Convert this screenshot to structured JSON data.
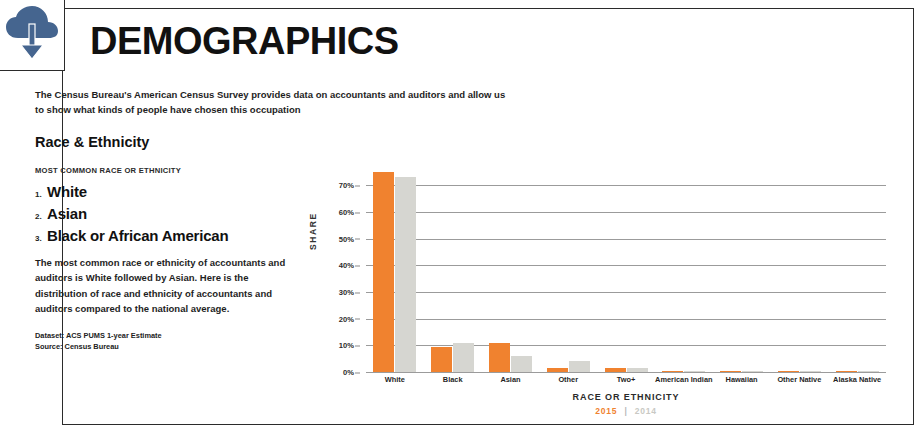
{
  "icons": {
    "cloud_download": "cloud-download-icon",
    "cloud_color": "#45658f"
  },
  "header": {
    "title": "DEMOGRAPHICS",
    "intro_line1": "The Census Bureau's American Census Survey provides data on accountants and auditors and allow us",
    "intro_line2": "to show what kinds of people have chosen this occupation",
    "section_heading": "Race & Ethnicity"
  },
  "left_column": {
    "rank_caption": "MOST COMMON RACE OR ETHNICITY",
    "ranks": [
      {
        "num": "1.",
        "label": "White"
      },
      {
        "num": "2.",
        "label": "Asian"
      },
      {
        "num": "3.",
        "label": "Black or African American"
      }
    ],
    "body_copy": "The most common race or ethnicity of accountants and auditors is White followed by Asian. Here is the distribution of race and ethnicity of accountants and auditors compared to the national average.",
    "dataset": "Dataset: ACS PUMS 1-year Estimate",
    "source": "Source: Census Bureau"
  },
  "chart_data": {
    "type": "bar",
    "title": "",
    "xlabel": "RACE OR ETHNICITY",
    "ylabel": "SHARE",
    "ylim": [
      0,
      75
    ],
    "grid": true,
    "legend_position": "bottom",
    "categories": [
      "White",
      "Black",
      "Asian",
      "Other",
      "Two+",
      "American Indian",
      "Hawaiian",
      "Other Native",
      "Alaska Native"
    ],
    "ytick_labels": [
      "0%",
      "10%",
      "20%",
      "30%",
      "40%",
      "50%",
      "60%",
      "70%"
    ],
    "ytick_values": [
      0,
      10,
      20,
      30,
      40,
      50,
      60,
      70
    ],
    "series": [
      {
        "name": "2015",
        "color": "#f0822f",
        "values": [
          75.0,
          9.5,
          11.0,
          1.5,
          1.5,
          0.4,
          0.2,
          0.3,
          0.2
        ]
      },
      {
        "name": "2014",
        "color": "#d6d6d1",
        "values": [
          73.0,
          11.0,
          6.0,
          4.0,
          1.5,
          0.5,
          0.3,
          0.4,
          0.3
        ]
      }
    ],
    "legend": {
      "current": "2015",
      "separator": "|",
      "previous": "2014"
    }
  }
}
